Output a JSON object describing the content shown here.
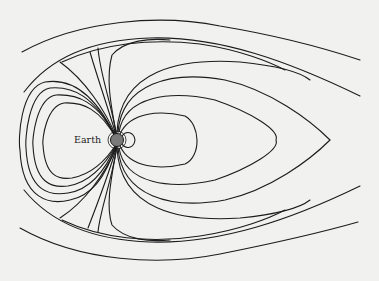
{
  "diagram": {
    "title": "",
    "type": "magnetosphere field lines",
    "labels": {
      "earth": "Earth"
    },
    "colors": {
      "background": "#f1f1f0",
      "line": "#1c1c1c",
      "earth_fill": "#7a7a7a"
    }
  }
}
